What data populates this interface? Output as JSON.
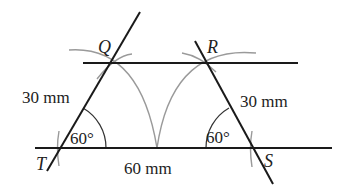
{
  "diagram": {
    "points": {
      "Q": {
        "label": "Q",
        "x": 110,
        "y": 63
      },
      "R": {
        "label": "R",
        "x": 205,
        "y": 63
      },
      "S": {
        "label": "S",
        "x": 252,
        "y": 148
      },
      "T": {
        "label": "T",
        "x": 60,
        "y": 148
      }
    },
    "measurements": {
      "TQ": "30 mm",
      "RS": "30 mm",
      "TS": "60 mm"
    },
    "angles": {
      "T": "60°",
      "S": "60°"
    },
    "colors": {
      "line": "#1a1a1a",
      "construction_arc": "#9a9a9a",
      "text": "#222222"
    }
  }
}
